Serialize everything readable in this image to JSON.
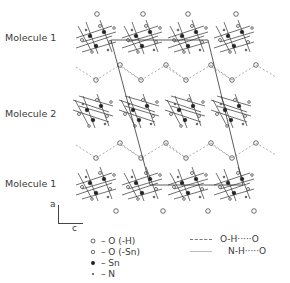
{
  "figure": {
    "type": "crystal-packing-diagram",
    "row_labels": [
      {
        "text": "Molecule 1",
        "position": "top"
      },
      {
        "text": "Molecule 2",
        "position": "middle"
      },
      {
        "text": "Molecule 1",
        "position": "bottom"
      }
    ],
    "axes": {
      "vertical": "a",
      "horizontal": "c"
    },
    "atom_legend": [
      {
        "symbol": "open-circle",
        "glyph": "o",
        "label": "– O (-H)"
      },
      {
        "symbol": "small-open-circle",
        "glyph": "∘",
        "label": "– O (-Sn)"
      },
      {
        "symbol": "filled-circle",
        "glyph": "●",
        "label": "– Sn"
      },
      {
        "symbol": "small-dot",
        "glyph": "•",
        "label": "– N"
      }
    ],
    "bond_legend": [
      {
        "style": "dashed",
        "label": "O-H·····O"
      },
      {
        "style": "solid-light",
        "label": "N-H·····O"
      }
    ],
    "colors": {
      "ink": "#333333",
      "hbond": "#888888",
      "background": "#ffffff"
    }
  }
}
